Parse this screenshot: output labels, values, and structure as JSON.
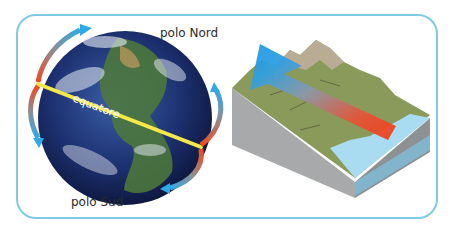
{
  "diagram": {
    "labels": {
      "north_pole": "polo Nord",
      "south_pole": "polo Sud",
      "equator": "equatore"
    },
    "colors": {
      "frame_border": "#7ecbe3",
      "equator_line": "#f5e84a",
      "cold_arrow": "#2fa8e8",
      "warm_arrow": "#f04a1e",
      "terrain_green": "#8a9a5b",
      "water": "#a9dcf0",
      "block_side": "#a7a9ab"
    },
    "panels": [
      {
        "name": "globe-circulation",
        "description": "Earth globe with tilted equator and curved warm-to-cold arrows toward poles"
      },
      {
        "name": "terrain-block",
        "description": "3D landscape block with mountains and sea, arrow from warm sea toward cold mountains"
      }
    ]
  }
}
